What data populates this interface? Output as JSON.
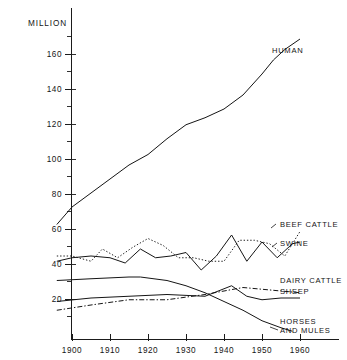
{
  "chart_data": {
    "type": "line",
    "title": "",
    "subtitle": "",
    "xlabel": "",
    "ylabel": "MILLION",
    "unit_label": "MILLION",
    "xlim": [
      1895,
      1963
    ],
    "ylim": [
      0,
      175
    ],
    "y_ticks_major": [
      20,
      40,
      60,
      80,
      100,
      120,
      140,
      160
    ],
    "y_ticks_minor": [
      10,
      30,
      50,
      70,
      90,
      110,
      130,
      150,
      170
    ],
    "y_tick_labels": [
      "20",
      "40",
      "60",
      "80",
      "100",
      "120",
      "140",
      "160"
    ],
    "x_ticks": [
      1900,
      1910,
      1920,
      1930,
      1940,
      1950,
      1960
    ],
    "x_tick_labels": [
      "1900",
      "1910",
      "1920",
      "1930",
      "1940",
      "1950",
      "1960"
    ],
    "grid": false,
    "legend_position": "right-inline-labels",
    "series": [
      {
        "name": "HUMAN",
        "label": "HUMAN",
        "style": "solid",
        "x": [
          1896,
          1900,
          1905,
          1910,
          1915,
          1920,
          1925,
          1930,
          1935,
          1940,
          1945,
          1950,
          1953,
          1956,
          1960
        ],
        "values": [
          66,
          76,
          84,
          92,
          100,
          106,
          115,
          123,
          127,
          132,
          140,
          152,
          160,
          166,
          172
        ]
      },
      {
        "name": "BEEF CATTLE",
        "label": "BEEF CATTLE",
        "style": "dotted",
        "x": [
          1896,
          1900,
          1905,
          1908,
          1912,
          1916,
          1920,
          1924,
          1928,
          1932,
          1936,
          1940,
          1944,
          1948,
          1952,
          1956,
          1960
        ],
        "values": [
          48,
          48,
          45,
          52,
          47,
          53,
          58,
          54,
          47,
          47,
          45,
          45,
          57,
          57,
          55,
          48,
          62
        ]
      },
      {
        "name": "SWINE",
        "label": "SWINE",
        "style": "solid",
        "x": [
          1896,
          1900,
          1905,
          1910,
          1914,
          1918,
          1922,
          1926,
          1930,
          1934,
          1938,
          1942,
          1946,
          1950,
          1954,
          1958,
          1960
        ],
        "values": [
          45,
          47,
          48,
          47,
          44,
          52,
          47,
          48,
          50,
          40,
          48,
          60,
          45,
          56,
          47,
          55,
          56
        ]
      },
      {
        "name": "DAIRY CATTLE",
        "label": "DAIRY CATTLE",
        "style": "dash-dot",
        "x": [
          1896,
          1905,
          1915,
          1925,
          1935,
          1940,
          1945,
          1950,
          1955,
          1960
        ],
        "values": [
          17,
          20,
          23,
          23,
          26,
          28,
          30,
          29,
          28,
          27
        ]
      },
      {
        "name": "SHEEP",
        "label": "SHEEP",
        "style": "solid",
        "x": [
          1896,
          1905,
          1915,
          1925,
          1935,
          1942,
          1946,
          1950,
          1955,
          1960
        ],
        "values": [
          22,
          24,
          25,
          26,
          25,
          31,
          25,
          23,
          24,
          24
        ]
      },
      {
        "name": "HORSES AND MULES",
        "label_line1": "HORSES",
        "label_line2": "AND MULES",
        "label": "HORSES AND MULES",
        "style": "solid",
        "x": [
          1896,
          1905,
          1915,
          1918,
          1925,
          1930,
          1935,
          1940,
          1945,
          1950,
          1955,
          1958
        ],
        "values": [
          34,
          35,
          36,
          36,
          34,
          31,
          27,
          22,
          17,
          11,
          7,
          5
        ]
      }
    ]
  },
  "labels": {
    "unit": "MILLION",
    "human": "HUMAN",
    "beef_cattle": "BEEF CATTLE",
    "swine": "SWINE",
    "dairy_cattle": "DAIRY CATTLE",
    "sheep": "SHEEP",
    "horses_line1": "HORSES",
    "horses_line2": "AND MULES",
    "y20": "20",
    "y40": "40",
    "y60": "60",
    "y80": "80",
    "y100": "100",
    "y120": "120",
    "y140": "140",
    "y160": "160",
    "x1900": "1900",
    "x1910": "1910",
    "x1920": "1920",
    "x1930": "1930",
    "x1940": "1940",
    "x1950": "1950",
    "x1960": "1960"
  },
  "colors": {
    "ink": "#151515",
    "background": "#ffffff"
  }
}
